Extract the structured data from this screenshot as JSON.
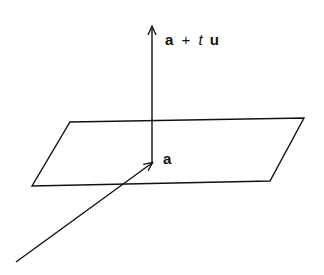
{
  "diagram": {
    "labels": {
      "top_vec_a": "a",
      "top_plus": "+",
      "top_t": "t",
      "top_u": "u",
      "point_a": "a"
    },
    "elements": [
      "plane",
      "normal-arrow",
      "incoming-arrow"
    ],
    "stroke_color": "#111111",
    "background": "#ffffff"
  }
}
